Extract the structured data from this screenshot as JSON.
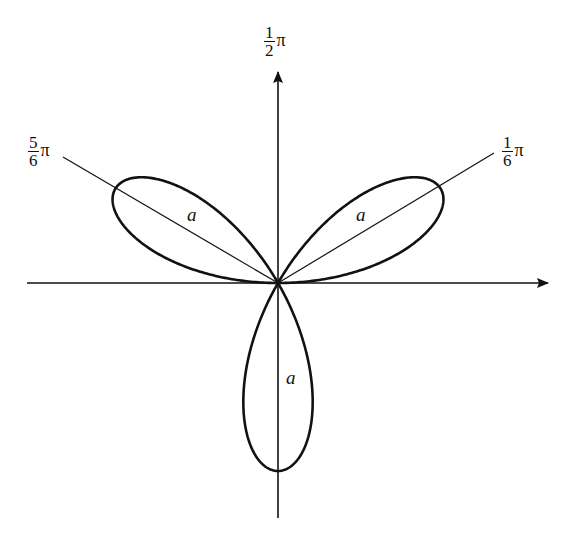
{
  "diagram": {
    "origin": [
      278,
      283
    ],
    "petal_length_px": 188,
    "stroke_color": "#111111",
    "axes": {
      "horizontal": {
        "x1": 27,
        "x2": 548,
        "y": 283,
        "arrow": "right"
      },
      "vertical": {
        "x": 278,
        "y1": 518,
        "y2": 72,
        "arrow": "up"
      }
    },
    "rays": [
      {
        "label_num": "1",
        "label_den": "6",
        "label_sym": "π",
        "angle": "1/6 π",
        "end": [
          494,
          153
        ]
      },
      {
        "label_num": "5",
        "label_den": "6",
        "label_sym": "π",
        "angle": "5/6 π",
        "end": [
          63,
          157
        ]
      }
    ],
    "axis_label": {
      "num": "1",
      "den": "2",
      "sym": "π",
      "angle": "1/2 π"
    },
    "petal_labels": [
      {
        "text": "a",
        "position": "upper-left petal"
      },
      {
        "text": "a",
        "position": "upper-right petal"
      },
      {
        "text": "a",
        "position": "lower petal"
      }
    ]
  }
}
